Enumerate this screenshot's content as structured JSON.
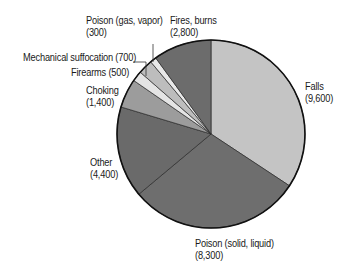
{
  "chart_data": {
    "type": "pie",
    "title": "",
    "total": 28000,
    "start_angle_deg": 0,
    "direction": "clockwise",
    "slices": [
      {
        "label": "Falls",
        "value": 9600,
        "display": "(9,600)",
        "color": "#c4c4c4"
      },
      {
        "label": "Poison (solid, liquid)",
        "value": 8300,
        "display": "(8,300)",
        "color": "#6e6e6e"
      },
      {
        "label": "Other",
        "value": 4400,
        "display": "(4,400)",
        "color": "#6a6a6a"
      },
      {
        "label": "Choking",
        "value": 1400,
        "display": "(1,400)",
        "color": "#9c9c9c"
      },
      {
        "label": "Firearms",
        "value": 500,
        "display": "(500)",
        "color": "#e4e4e4"
      },
      {
        "label": "Mechanical suffocation",
        "value": 700,
        "display": "(700)",
        "color": "#bdbdbd"
      },
      {
        "label": "Poison (gas, vapor)",
        "value": 300,
        "display": "(300)",
        "color": "#e8e8e8"
      },
      {
        "label": "Fires, burns",
        "value": 2800,
        "display": "(2,800)",
        "color": "#6c6c6c"
      }
    ]
  },
  "labels": {
    "falls": {
      "name": "Falls",
      "value": "(9,600)"
    },
    "poison_solid": {
      "name": "Poison (solid, liquid)",
      "value": "(8,300)"
    },
    "other": {
      "name": "Other",
      "value": "(4,400)"
    },
    "choking": {
      "name": "Choking",
      "value": "(1,400)"
    },
    "firearms": {
      "line": "Firearms (500)"
    },
    "mechanical": {
      "line": "Mechanical suffocation (700)"
    },
    "poison_gas": {
      "name": "Poison (gas, vapor)",
      "value": "(300)"
    },
    "fires": {
      "name": "Fires, burns",
      "value": "(2,800)"
    }
  }
}
